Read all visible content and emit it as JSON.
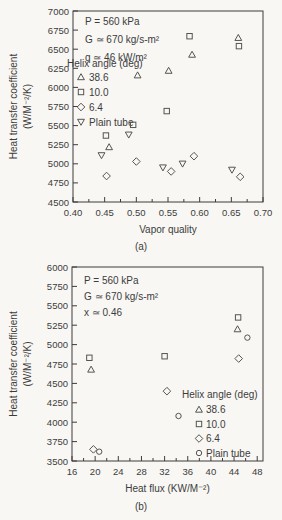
{
  "page": {
    "background": "#f8f7f4",
    "ink": "#3c3c3c",
    "marker_stroke": "#555550"
  },
  "chart_data": [
    {
      "id": "a",
      "type": "scatter",
      "sublabel": "(a)",
      "annotations": [
        "P = 560 kPa",
        "G ≃ 670 kg/s-m²",
        "q ≃ 46 kW/m²"
      ],
      "xlabel": "Vapor quality",
      "ylabel_lines": [
        "Heat transfer coefficient",
        "(W/M⁻²/K)"
      ],
      "xlim": [
        0.4,
        0.7
      ],
      "ylim": [
        4500,
        7000
      ],
      "xtick_values": [
        0.4,
        0.45,
        0.5,
        0.55,
        0.6,
        0.65,
        0.7
      ],
      "xtick_labels": [
        "0.40",
        "0.45",
        "0.50",
        "0.55",
        "0.60",
        "0.65",
        "0.70"
      ],
      "xminor_values": [
        0.425,
        0.475,
        0.525,
        0.575,
        0.625,
        0.675
      ],
      "ytick_values": [
        4500,
        4750,
        5000,
        5250,
        5500,
        5750,
        6000,
        6250,
        6500,
        6750,
        7000
      ],
      "ytick_labels": [
        "4500",
        "4750",
        "5000",
        "5250",
        "5500",
        "5750",
        "6000",
        "6250",
        "6500",
        "6750",
        "7000"
      ],
      "grid": false,
      "legend": {
        "title": "Helix angle (deg)",
        "position": "upper-left",
        "entries": [
          {
            "marker": "triangle-up",
            "label": "38.6"
          },
          {
            "marker": "square",
            "label": "10.0"
          },
          {
            "marker": "diamond",
            "label": "6.4"
          },
          {
            "marker": "triangle-down",
            "label": "Plain tube"
          }
        ]
      },
      "series": [
        {
          "name": "38.6",
          "marker": "triangle-up",
          "points": [
            [
              0.457,
              5220
            ],
            [
              0.502,
              6160
            ],
            [
              0.551,
              6220
            ],
            [
              0.588,
              6430
            ],
            [
              0.661,
              6650
            ]
          ]
        },
        {
          "name": "10.0",
          "marker": "square",
          "points": [
            [
              0.452,
              5370
            ],
            [
              0.495,
              5510
            ],
            [
              0.548,
              5690
            ],
            [
              0.584,
              6670
            ],
            [
              0.662,
              6540
            ]
          ]
        },
        {
          "name": "6.4",
          "marker": "diamond",
          "points": [
            [
              0.453,
              4840
            ],
            [
              0.5,
              5030
            ],
            [
              0.555,
              4900
            ],
            [
              0.591,
              5100
            ],
            [
              0.664,
              4830
            ]
          ]
        },
        {
          "name": "Plain tube",
          "marker": "triangle-down",
          "points": [
            [
              0.445,
              5110
            ],
            [
              0.488,
              5380
            ],
            [
              0.542,
              4950
            ],
            [
              0.573,
              5000
            ],
            [
              0.651,
              4920
            ]
          ]
        }
      ]
    },
    {
      "id": "b",
      "type": "scatter",
      "sublabel": "(b)",
      "annotations": [
        "P = 560 kPa",
        "G ≃ 670 kg/s-m²",
        "x ≃ 0.46"
      ],
      "xlabel": "Heat flux (KW/M⁻²)",
      "ylabel_lines": [
        "Heat transfer coefficient",
        "(W/M⁻²/K)"
      ],
      "xlim": [
        16,
        49
      ],
      "ylim": [
        3500,
        6000
      ],
      "xtick_values": [
        16,
        20,
        24,
        28,
        32,
        36,
        40,
        44,
        48
      ],
      "xtick_labels": [
        "16",
        "20",
        "24",
        "28",
        "32",
        "36",
        "40",
        "44",
        "48"
      ],
      "xminor_values": [
        18,
        22,
        26,
        30,
        34,
        38,
        42,
        46
      ],
      "ytick_values": [
        3500,
        3750,
        4000,
        4250,
        4500,
        4750,
        5000,
        5250,
        5500,
        5750,
        6000
      ],
      "ytick_labels": [
        "3500",
        "3750",
        "4000",
        "4250",
        "4500",
        "4750",
        "5000",
        "5250",
        "5500",
        "5750",
        "6000"
      ],
      "grid": false,
      "legend": {
        "title": "Helix angle (deg)",
        "position": "mid-right",
        "entries": [
          {
            "marker": "triangle-up",
            "label": "38.6"
          },
          {
            "marker": "square",
            "label": "10.0"
          },
          {
            "marker": "diamond",
            "label": "6.4"
          },
          {
            "marker": "circle",
            "label": "Plain tube"
          }
        ]
      },
      "series": [
        {
          "name": "38.6",
          "marker": "triangle-up",
          "points": [
            [
              19.3,
              4680
            ],
            [
              44.6,
              5200
            ]
          ]
        },
        {
          "name": "10.0",
          "marker": "square",
          "points": [
            [
              19.0,
              4830
            ],
            [
              32.0,
              4850
            ],
            [
              44.7,
              5350
            ]
          ]
        },
        {
          "name": "6.4",
          "marker": "diamond",
          "points": [
            [
              19.7,
              3650
            ],
            [
              32.4,
              4400
            ],
            [
              44.8,
              4820
            ]
          ]
        },
        {
          "name": "Plain tube",
          "marker": "circle",
          "points": [
            [
              20.7,
              3620
            ],
            [
              34.4,
              4080
            ],
            [
              46.3,
              5090
            ]
          ]
        }
      ]
    }
  ]
}
